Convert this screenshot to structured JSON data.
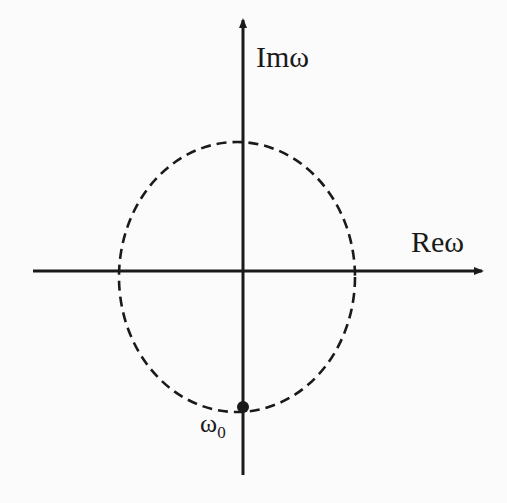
{
  "diagram": {
    "type": "complex-plane",
    "axes": {
      "vertical_label": "Imω",
      "horizontal_label": "Reω"
    },
    "contour": {
      "style": "dashed",
      "shape": "closed loop around origin"
    },
    "point": {
      "label_base": "ω",
      "label_sub": "0",
      "position": "bottom of contour on imaginary axis"
    },
    "colors": {
      "ink": "#1a1a1a",
      "background": "#fbfbfb"
    }
  }
}
